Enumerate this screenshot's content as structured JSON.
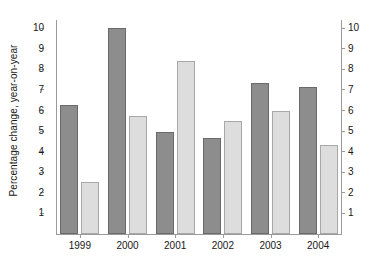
{
  "chart_data": {
    "type": "bar",
    "title": "",
    "xlabel": "",
    "ylabel": "Percentage change, year-on-year",
    "categories": [
      "1999",
      "2000",
      "2001",
      "2002",
      "2003",
      "2004"
    ],
    "series": [
      {
        "name": "dark-series",
        "color": "#8d8d8d",
        "values": [
          6.25,
          10.0,
          4.95,
          4.65,
          7.35,
          7.15
        ]
      },
      {
        "name": "light-series",
        "color": "#dddddd",
        "values": [
          2.55,
          5.75,
          8.4,
          5.5,
          6.0,
          4.35
        ]
      }
    ],
    "ylim": [
      0,
      10.4
    ],
    "yticks": [
      1,
      2,
      3,
      4,
      5,
      6,
      7,
      8,
      9,
      10
    ],
    "ytick_labels": [
      "1",
      "2",
      "3",
      "4",
      "5",
      "6",
      "7",
      "8",
      "9",
      "10"
    ],
    "right_axis": {
      "yticks": [
        1,
        2,
        3,
        4,
        5,
        6,
        7,
        8,
        9,
        10
      ],
      "ytick_labels": [
        "1",
        "2",
        "3",
        "4",
        "5",
        "6",
        "7",
        "8",
        "9",
        "10"
      ]
    },
    "grid": false,
    "legend": "none",
    "axis_color": "#9a9a9a"
  },
  "axes": {
    "ylabel": "Percentage change, year-on-year"
  },
  "ytick_labels": [
    "10",
    "9",
    "8",
    "7",
    "6",
    "5",
    "4",
    "3",
    "2",
    "1"
  ],
  "ytick_labels_right": [
    "10",
    "9",
    "8",
    "7",
    "6",
    "5",
    "4",
    "3",
    "2",
    "1"
  ],
  "xtick_labels": [
    "1999",
    "2000",
    "2001",
    "2002",
    "2003",
    "2004"
  ]
}
